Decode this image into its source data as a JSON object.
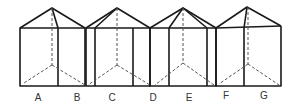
{
  "figure": {
    "labels": [
      {
        "text": "A",
        "x": 31
      },
      {
        "text": "B",
        "x": 70
      },
      {
        "text": "C",
        "x": 105
      },
      {
        "text": "D",
        "x": 146
      },
      {
        "text": "E",
        "x": 182
      },
      {
        "text": "F",
        "x": 219
      },
      {
        "text": "G",
        "x": 257
      }
    ]
  }
}
